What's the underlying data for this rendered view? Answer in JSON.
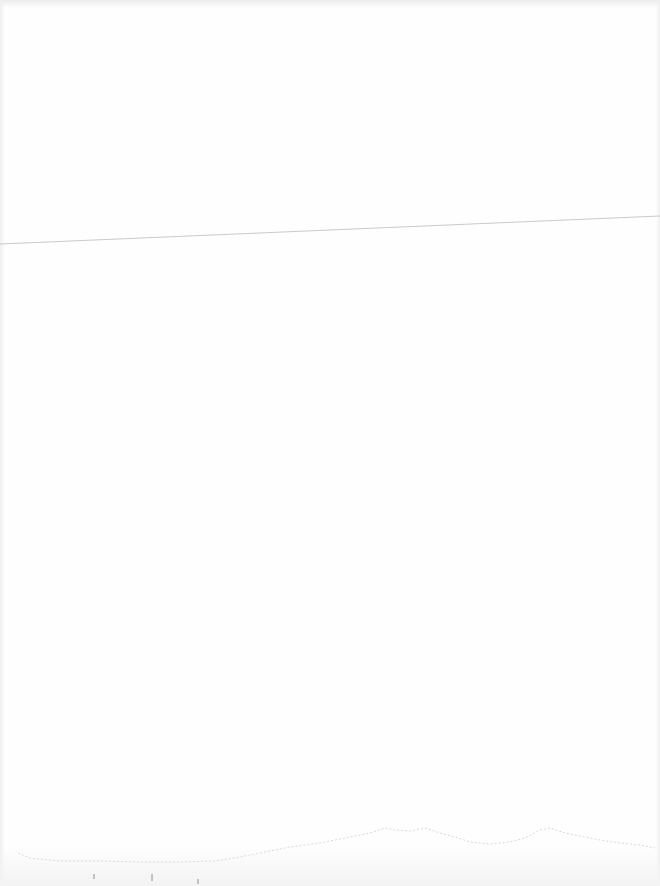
{
  "page": {
    "background_color": "#fefefe",
    "line_color": "#b8b8b8",
    "horizon_color": "#c8c8c8"
  }
}
